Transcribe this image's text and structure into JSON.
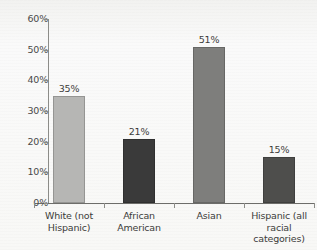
{
  "chart_data": {
    "type": "bar",
    "title": "",
    "xlabel": "",
    "ylabel": "",
    "ylim": [
      0,
      60
    ],
    "grid": false,
    "legend": "none",
    "y_ticks": [
      "0%",
      "10%",
      "20%",
      "30%",
      "40%",
      "50%",
      "60%"
    ],
    "y_tick_values": [
      0,
      10,
      20,
      30,
      40,
      50,
      60
    ],
    "categories": [
      "White (not Hispanic)",
      "African American",
      "Asian",
      "Hispanic (all racial categories)"
    ],
    "category_lines": [
      [
        "White (not",
        "Hispanic)"
      ],
      [
        "African",
        "American"
      ],
      [
        "Asian"
      ],
      [
        "Hispanic (all",
        "racial categories)"
      ]
    ],
    "values": [
      35,
      21,
      51,
      15
    ],
    "value_labels": [
      "35%",
      "21%",
      "51%",
      "15%"
    ],
    "bar_colors": [
      "#b6b6b4",
      "#3a3a3a",
      "#7e7e7c",
      "#4e4e4c"
    ],
    "axis_color": "#6d6d6a",
    "background_color": "#f7f7f5",
    "text_color": "#3c3c3a"
  }
}
